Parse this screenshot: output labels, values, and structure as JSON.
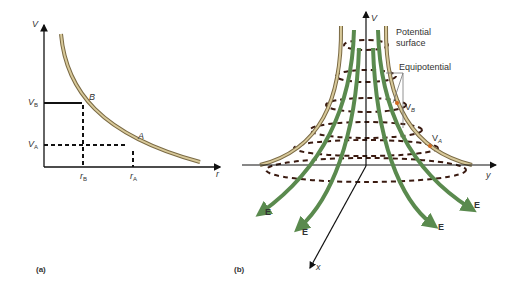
{
  "figure": {
    "panel_a": {
      "label": "(a)",
      "y_axis_label": "V",
      "x_axis_label": "r",
      "point_b": "B",
      "point_a": "A",
      "v_b": {
        "main": "V",
        "sub": "B"
      },
      "v_a": {
        "main": "V",
        "sub": "A"
      },
      "r_b": {
        "main": "r",
        "sub": "B"
      },
      "r_a": {
        "main": "r",
        "sub": "A"
      }
    },
    "panel_b": {
      "label": "(b)",
      "v_axis_label": "V",
      "y_axis_label": "y",
      "x_axis_label": "x",
      "potential_surface_line1": "Potential",
      "potential_surface_line2": "surface",
      "equipotential_label": "Equipotential",
      "v_b": {
        "main": "V",
        "sub": "B"
      },
      "v_a": {
        "main": "V",
        "sub": "A"
      },
      "field_label": "E"
    },
    "colors": {
      "surface": "#c9b98a",
      "surface_edge": "#7a6a44",
      "field_lines": "#5a8a4e",
      "equipotential": "#3a1a10",
      "marker": "#d2691e",
      "axes": "#111111"
    }
  }
}
